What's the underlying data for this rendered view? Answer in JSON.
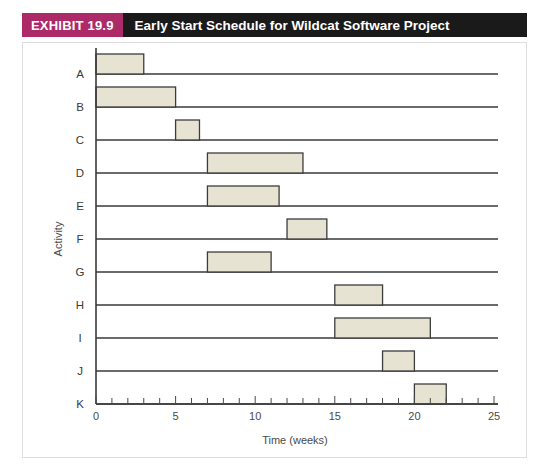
{
  "header": {
    "exhibit_label": "EXHIBIT 19.9",
    "title": "Early Start Schedule for Wildcat Software Project",
    "badge_color": "#ad2a68",
    "bar_color": "#1a1a1a",
    "text_color": "#ffffff"
  },
  "chart_data": {
    "type": "bar",
    "orientation": "horizontal",
    "subtype": "gantt",
    "title": "Early Start Schedule for Wildcat Software Project",
    "xlabel": "Time (weeks)",
    "ylabel": "Activity",
    "xlim": [
      0,
      25
    ],
    "ylim_categories": [
      "A",
      "B",
      "C",
      "D",
      "E",
      "F",
      "G",
      "H",
      "I",
      "J",
      "K"
    ],
    "categories": [
      "A",
      "B",
      "C",
      "D",
      "E",
      "F",
      "G",
      "H",
      "I",
      "J",
      "K"
    ],
    "x_ticks_major": [
      0,
      5,
      10,
      15,
      20,
      25
    ],
    "x_tick_labels": [
      "0",
      "5",
      "10",
      "15",
      "20",
      "25"
    ],
    "x_tick_minor_step": 1,
    "grid": false,
    "legend": "none",
    "bar_fill": "#e7e3d3",
    "bar_edge": "#3c3c3c",
    "tasks": [
      {
        "activity": "A",
        "start": 0,
        "end": 3,
        "duration": 3
      },
      {
        "activity": "B",
        "start": 0,
        "end": 5,
        "duration": 5
      },
      {
        "activity": "C",
        "start": 5,
        "end": 6.5,
        "duration": 1.5
      },
      {
        "activity": "D",
        "start": 7,
        "end": 13,
        "duration": 6
      },
      {
        "activity": "E",
        "start": 7,
        "end": 11.5,
        "duration": 4.5
      },
      {
        "activity": "F",
        "start": 12,
        "end": 14.5,
        "duration": 2.5
      },
      {
        "activity": "G",
        "start": 7,
        "end": 11,
        "duration": 4
      },
      {
        "activity": "H",
        "start": 15,
        "end": 18,
        "duration": 3
      },
      {
        "activity": "I",
        "start": 15,
        "end": 21,
        "duration": 6
      },
      {
        "activity": "J",
        "start": 18,
        "end": 20,
        "duration": 2
      },
      {
        "activity": "K",
        "start": 20,
        "end": 22,
        "duration": 2
      }
    ]
  }
}
